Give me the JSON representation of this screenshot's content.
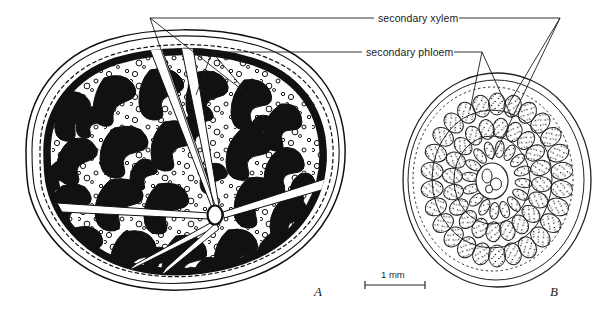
{
  "figure": {
    "background_color": "#ffffff",
    "ink_color": "#111111",
    "width": 600,
    "height": 318
  },
  "annotations": {
    "xylem_label": "secondary xylem",
    "phloem_label": "secondary phloem"
  },
  "panels": [
    {
      "letter": "A",
      "kind": "stem-cross-section-solid-ink",
      "center": [
        180,
        165
      ],
      "outline_rx": 172,
      "outline_ry": 133
    },
    {
      "letter": "B",
      "kind": "stem-cross-section-line-art",
      "center": [
        497,
        180
      ],
      "outline_rx": 95,
      "outline_ry": 108
    }
  ],
  "scale_bar": {
    "label": "1 mm",
    "x_start": 365,
    "x_end": 425,
    "y": 285
  },
  "chart_data": {
    "type": "diagram",
    "title": "",
    "labels": [
      "secondary xylem",
      "secondary phloem"
    ],
    "panel_labels": [
      "A",
      "B"
    ],
    "scale_bar_label": "1 mm"
  }
}
